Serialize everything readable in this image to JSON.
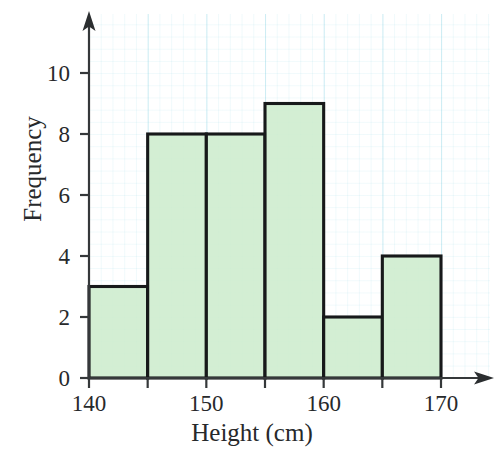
{
  "chart_data": {
    "type": "bar",
    "title": "",
    "subtitle": "",
    "xlabel": "Height (cm)",
    "ylabel": "Frequency",
    "categories": [
      "140-145",
      "145-150",
      "150-155",
      "155-160",
      "160-165",
      "165-170"
    ],
    "bin_edges": [
      140,
      145,
      150,
      155,
      160,
      165,
      170
    ],
    "values": [
      3,
      8,
      8,
      9,
      2,
      4
    ],
    "bar_width_units": 5,
    "xlim": [
      140,
      173
    ],
    "ylim": [
      0,
      11.5
    ],
    "xticks": [
      140,
      145,
      150,
      155,
      160,
      165,
      170
    ],
    "xtick_labels": [
      "140",
      "",
      "150",
      "",
      "160",
      "",
      "170"
    ],
    "yticks": [
      0,
      2,
      4,
      6,
      8,
      10
    ],
    "ytick_labels": [
      "0",
      "2",
      "4",
      "6",
      "8",
      "10"
    ],
    "grid": true,
    "grid_color": "#8cd7e6",
    "legend": null,
    "bar_fill_color": "#cdeccd",
    "bar_edge_color": "#17191a",
    "axis_color": "#35383a",
    "background_color": "#ffffff",
    "x_axis_has_arrow": true,
    "y_axis_has_arrow": true
  }
}
